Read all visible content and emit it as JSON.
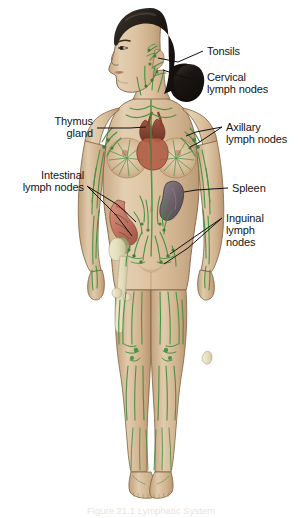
{
  "labels": {
    "tonsils": "Tonsils",
    "cervical": "Cervical\nlymph nodes",
    "axillary": "Axillary\nlymph nodes",
    "spleen": "Spleen",
    "inguinal": "Inguinal\nlymph\nnodes",
    "thymus": "Thymus\ngland",
    "intestinal": "Intestinal\nlymph nodes"
  },
  "caption": "Figure 21.1  Lymphatic System",
  "colors": {
    "background": "#ffffff",
    "skin": "#d8bd9b",
    "skin_shadow": "#c4a684",
    "skin_light": "#e6d2b6",
    "outline": "#6b5338",
    "hair": "#1c1815",
    "lymph_green": "#3f8f3f",
    "lymph_green_light": "#6aa84f",
    "thymus": "#8c4434",
    "heart": "#a8503c",
    "spleen": "#7c6f77",
    "intestine": "#c07a6a",
    "bone": "#e8e4c4",
    "label_text": "#141414",
    "leader_line": "#111111"
  }
}
